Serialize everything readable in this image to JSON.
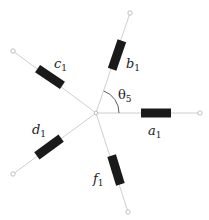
{
  "diagram": {
    "center": {
      "x": 96,
      "y": 113
    },
    "branches": [
      {
        "id": "a",
        "label": "a",
        "sub": "1",
        "end": [
          200,
          113
        ],
        "res": [
          156,
          113
        ],
        "angle": 0,
        "lblPos": [
          148,
          135
        ]
      },
      {
        "id": "b",
        "label": "b",
        "sub": "1",
        "end": [
          130,
          13
        ],
        "res": [
          117,
          55
        ],
        "angle": -71,
        "lblPos": [
          126,
          68
        ]
      },
      {
        "id": "c",
        "label": "c",
        "sub": "1",
        "end": [
          13,
          51
        ],
        "res": [
          50,
          77
        ],
        "angle": 34,
        "lblPos": [
          54,
          68
        ]
      },
      {
        "id": "d",
        "label": "d",
        "sub": "1",
        "end": [
          13,
          174
        ],
        "res": [
          49,
          147
        ],
        "angle": -36,
        "lblPos": [
          32,
          134
        ]
      },
      {
        "id": "f",
        "label": "f",
        "sub": "1",
        "end": [
          128,
          212
        ],
        "res": [
          116,
          170
        ],
        "angle": 73,
        "lblPos": [
          93,
          183
        ]
      }
    ],
    "angle_label": {
      "symbol": "θ",
      "sub": "5"
    },
    "colors": {
      "wire": "#c8c8c8",
      "resistor": "#1a1a1a",
      "text": "#222222"
    }
  }
}
